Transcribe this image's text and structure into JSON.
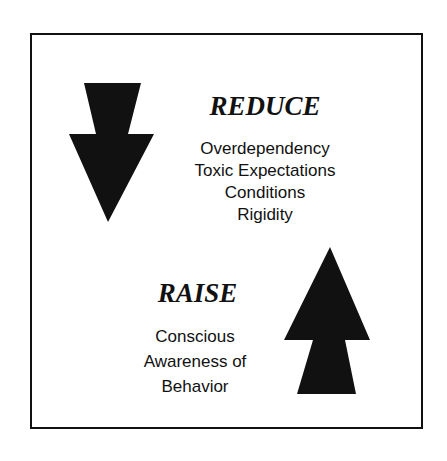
{
  "reduce": {
    "heading": "REDUCE",
    "items": [
      "Overdependency",
      "Toxic Expectations",
      "Conditions",
      "Rigidity"
    ],
    "icon": "down-arrow-icon"
  },
  "raise": {
    "heading": "RAISE",
    "items": [
      "Conscious",
      "Awareness of",
      "Behavior"
    ],
    "icon": "up-arrow-icon"
  },
  "colors": {
    "ink": "#111111",
    "background": "#ffffff"
  }
}
